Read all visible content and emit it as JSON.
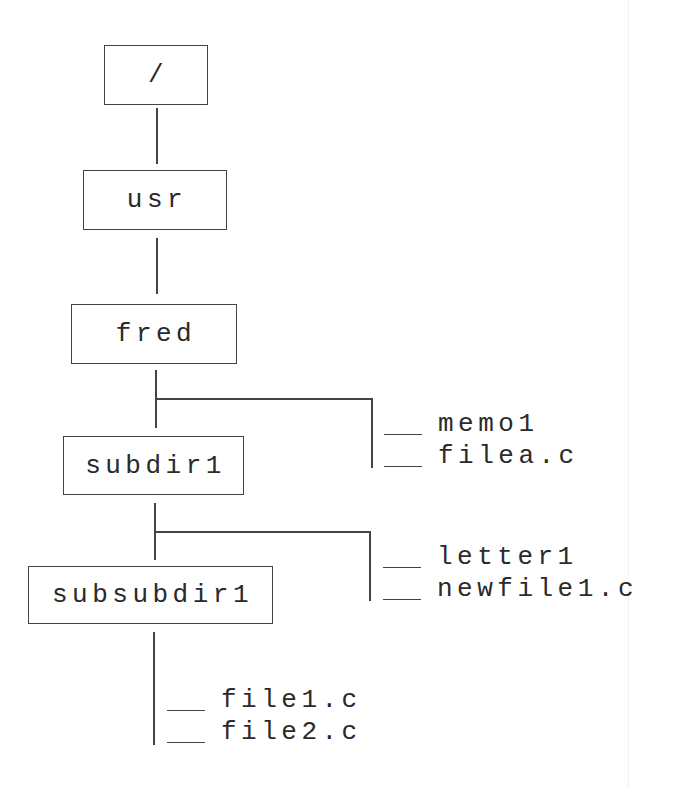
{
  "diagram": {
    "nodes": {
      "root": "/",
      "usr": "usr",
      "fred": "fred",
      "subdir1": "subdir1",
      "subsubdir1": "subsubdir1"
    },
    "files": {
      "fred": [
        "memo1",
        "filea.c"
      ],
      "subdir1": [
        "letter1",
        "newfile1.c"
      ],
      "subsubdir1": [
        "file1.c",
        "file2.c"
      ]
    }
  }
}
